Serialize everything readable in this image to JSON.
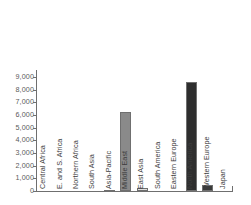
{
  "chart_data": {
    "type": "bar",
    "title": "",
    "subtitle": "",
    "xlabel": "",
    "ylabel": "",
    "ylim": [
      0,
      9000
    ],
    "ytick_values": [
      9000,
      8000,
      7000,
      6000,
      5000,
      4000,
      3000,
      2000,
      1000,
      0
    ],
    "ytick_labels": [
      "9,000",
      "8,000",
      "7,000",
      "6,000",
      "5,000",
      "4,000",
      "3,000",
      "2,000",
      "1,000",
      "0"
    ],
    "grid": false,
    "legend": null,
    "categories": [
      "Central Africa",
      "E. and S. Africa",
      "Northern Africa",
      "South Asia",
      "Asia-Pacific",
      "Middle East",
      "East Asia",
      "South America",
      "Eastern Europe",
      "North America",
      "Western Europe",
      "Japan"
    ],
    "values": [
      0,
      0,
      0,
      0,
      100,
      6200,
      250,
      0,
      0,
      8600,
      450,
      0
    ],
    "bar_colors": [
      "#ffffff",
      "#ffffff",
      "#ffffff",
      "#ffffff",
      "#d9d9d9",
      "#8a8a8a",
      "#e0e0e0",
      "#ffffff",
      "#ffffff",
      "#2e2e2e",
      "#3a3a3a",
      "#ffffff"
    ],
    "bar_edge_color": "#6f6f6f",
    "axis_color": "#6f6f6f",
    "tick_label_color": "#5b5b5b",
    "category_label_color": "#3d3d3d",
    "background_color": "#ffffff"
  }
}
